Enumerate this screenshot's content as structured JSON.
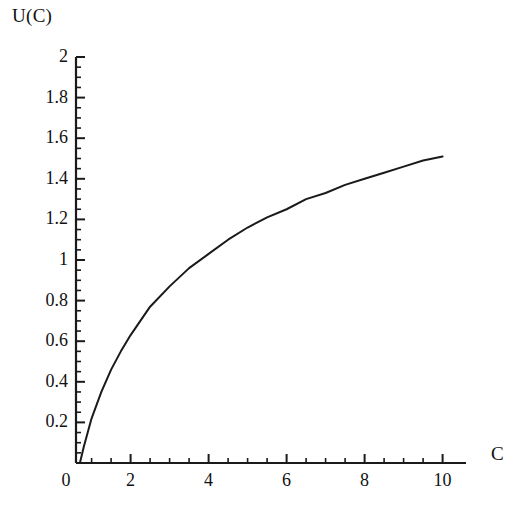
{
  "chart_data": {
    "type": "line",
    "title": "",
    "subtitle": "",
    "xlabel": "C",
    "ylabel": "U(C)",
    "xlim": [
      0,
      10
    ],
    "ylim": [
      0,
      2
    ],
    "grid": false,
    "legend": null,
    "x_ticks": [
      0,
      2,
      4,
      6,
      8,
      10
    ],
    "x_tick_labels": [
      "0",
      "2",
      "4",
      "6",
      "8",
      "10"
    ],
    "x_minor_step": 0.5,
    "y_ticks": [
      0,
      0.2,
      0.4,
      0.6,
      0.8,
      1,
      1.2,
      1.4,
      1.6,
      1.8,
      2
    ],
    "y_tick_labels": [
      "0",
      "0.2",
      "0.4",
      "0.6",
      "0.8",
      "1",
      "1.2",
      "1.4",
      "1.6",
      "1.8",
      "2"
    ],
    "y_minor_step": 0.05,
    "series": [
      {
        "name": "U(C)",
        "color": "#1a1a1a",
        "x": [
          0.7,
          0.8,
          0.9,
          1.0,
          1.25,
          1.5,
          1.75,
          2.0,
          2.5,
          3.0,
          3.5,
          4.0,
          4.5,
          5.0,
          5.5,
          6.0,
          6.5,
          7.0,
          7.5,
          8.0,
          8.5,
          9.0,
          9.5,
          10.0
        ],
        "y": [
          0.0,
          0.08,
          0.15,
          0.22,
          0.35,
          0.46,
          0.55,
          0.63,
          0.77,
          0.87,
          0.96,
          1.03,
          1.1,
          1.16,
          1.21,
          1.25,
          1.3,
          1.33,
          1.37,
          1.4,
          1.43,
          1.46,
          1.49,
          1.51
        ]
      }
    ],
    "annotations": []
  },
  "axis_labels": {
    "y_axis_title": "U(C)",
    "x_axis_title": "C"
  },
  "style": {
    "axis_color": "#1a1a1a",
    "curve_color": "#1a1a1a",
    "background": "#ffffff"
  }
}
